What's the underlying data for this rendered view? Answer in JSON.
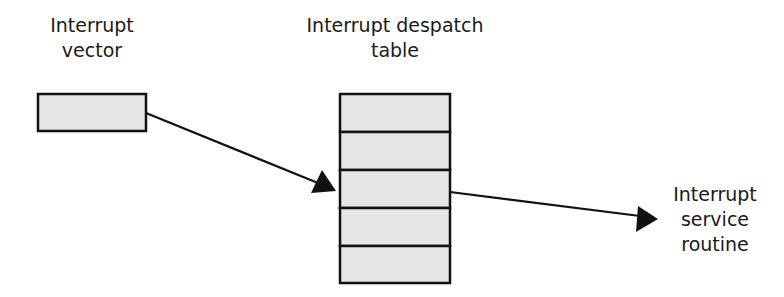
{
  "diagram": {
    "nodes": {
      "vector": {
        "label_lines": [
          "Interrupt",
          "vector"
        ]
      },
      "table": {
        "label_lines": [
          "Interrupt despatch",
          "table"
        ],
        "rows": 5
      },
      "routine": {
        "label_lines": [
          "Interrupt",
          "service",
          "routine"
        ]
      }
    },
    "edges": [
      {
        "from": "vector",
        "to": "table row 3"
      },
      {
        "from": "table row 3",
        "to": "routine"
      }
    ],
    "colors": {
      "box_fill": "#e6e6e6",
      "stroke": "#111111",
      "text": "#1a1a1a"
    }
  }
}
